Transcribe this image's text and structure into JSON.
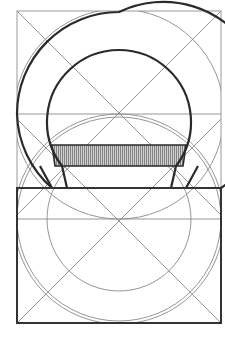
{
  "diagram": {
    "type": "geometric construction",
    "colors": {
      "background": "#ffffff",
      "construction_line": "#8a8a8a",
      "outline": "#2a2a2a",
      "hatch_fill": "#b5b5b5"
    },
    "frame": {
      "x": 17,
      "y": 11,
      "width": 204,
      "height": 312
    },
    "upper_square": {
      "x": 17,
      "y": 11,
      "size": 204,
      "center": [
        119,
        114
      ]
    },
    "lower_rect": {
      "x": 17,
      "y": 188,
      "width": 204,
      "height": 135,
      "center": [
        119,
        219
      ]
    },
    "outer_ring_radius": 102,
    "inner_ring_radius": 72,
    "hatched_band": {
      "top": 145,
      "bottom": 166
    },
    "feet": {
      "left": {
        "points": [
          [
            52,
            166
          ],
          [
            67,
            188
          ],
          [
            17,
            188
          ]
        ]
      },
      "right": {
        "points": [
          [
            186,
            166
          ],
          [
            171,
            188
          ],
          [
            221,
            188
          ]
        ]
      }
    }
  }
}
